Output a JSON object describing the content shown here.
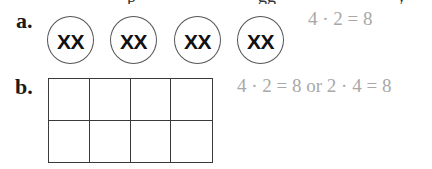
{
  "clipped_top_text": {
    "fragments": [
      {
        "text": "p",
        "x": 127
      },
      {
        "text": "gg",
        "x": 258
      },
      {
        "text": "y",
        "x": 397
      }
    ]
  },
  "problems": [
    {
      "label": "a.",
      "model": "circles",
      "groups": [
        "XX",
        "XX",
        "XX",
        "XX"
      ],
      "equation": "4 · 2 = 8"
    },
    {
      "label": "b.",
      "model": "array",
      "rows": 2,
      "columns": 4,
      "equation": "4 · 2 = 8 or 2 · 4 = 8"
    }
  ],
  "colors": {
    "answer_text": "#a8a8a8",
    "label_text": "#1a1a1a",
    "lines": "#3a3a3a"
  }
}
